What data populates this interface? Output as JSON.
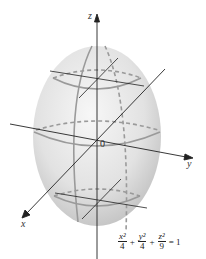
{
  "figure": {
    "type": "ellipsoid-diagram",
    "labels": {
      "z_axis": "z",
      "y_axis": "y",
      "x_axis": "x",
      "origin": "0"
    },
    "equation": {
      "terms": [
        {
          "numerator": "x²",
          "denominator": "4"
        },
        {
          "numerator": "y²",
          "denominator": "4"
        },
        {
          "numerator": "z²",
          "denominator": "9"
        }
      ],
      "plus": "+",
      "equals": "= 1"
    },
    "colors": {
      "surface_light": "#f2f2f2",
      "surface_dark": "#bdbdbd",
      "trace_curves": "#9a9a9a",
      "axes": "#222222",
      "background": "#ffffff"
    }
  }
}
